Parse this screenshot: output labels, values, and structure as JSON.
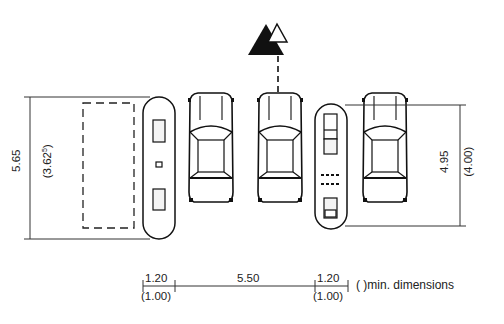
{
  "diagram": {
    "north_arrow": {
      "icon": "north-arrow-icon"
    },
    "left_dimension": {
      "value": "5.65",
      "min_value": "(3.62",
      "min_sup": "5",
      "min_close": ")"
    },
    "right_dimension": {
      "value": "4.95",
      "min_value": "(4.00)"
    },
    "bottom_dimensions": [
      {
        "value": "1.20",
        "min_value": "(1.00)"
      },
      {
        "value": "5.50"
      },
      {
        "value": "1.20",
        "min_value": "(1.00)"
      }
    ],
    "legend": {
      "text": "( )min. dimensions"
    },
    "elements": [
      {
        "type": "dashed-parking-space"
      },
      {
        "type": "island-platform-left"
      },
      {
        "type": "car",
        "count": 2
      },
      {
        "type": "island-platform-right"
      },
      {
        "type": "car",
        "count": 1
      }
    ]
  }
}
